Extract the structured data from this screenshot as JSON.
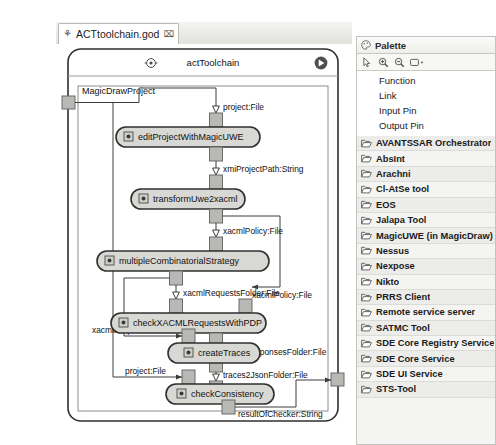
{
  "window": {
    "tab": {
      "label": "ACTtoolchain.god",
      "close_label": "⌧",
      "icon": "activity-diagram-icon"
    }
  },
  "diagram": {
    "title": "actToolchain",
    "title_icon": "activity-icon",
    "run_button_icon": "play-circle-icon",
    "frame_label": "MagicDrawProject",
    "nodes": [
      {
        "id": "n1",
        "label": "editProjectWithMagicUWE"
      },
      {
        "id": "n2",
        "label": "transformUwe2xacml"
      },
      {
        "id": "n3",
        "label": "multipleCombinatorialStrategy"
      },
      {
        "id": "n4",
        "label": "checkXACMLRequestsWithPDP"
      },
      {
        "id": "n5",
        "label": "createTraces"
      },
      {
        "id": "n6",
        "label": "checkConsistency"
      }
    ],
    "edge_labels": {
      "e1": "project:File",
      "e2": "xmiProjectPath:String",
      "e3": "xacmlPolicy:File",
      "e4": "xacmlRequestsFolder:File",
      "e5": "xacmlPolicy:File",
      "e6": "xacmlRequestsFolder:File",
      "e7": "xacmlResponsesFolder:File",
      "e8": "traces2JsonFolder:File",
      "e9": "project:File",
      "e10": "resultOfChecker:String"
    }
  },
  "palette": {
    "title": "Palette",
    "title_icon": "palette-icon",
    "tools": [
      {
        "name": "select-tool",
        "icon": "cursor-arrow-icon"
      },
      {
        "name": "zoom-in-tool",
        "icon": "zoom-in-icon"
      },
      {
        "name": "zoom-out-tool",
        "icon": "zoom-out-icon"
      },
      {
        "name": "layout-tool",
        "icon": "layout-dropdown-icon"
      }
    ],
    "basic_items": [
      "Function",
      "Link",
      "Input Pin",
      "Output Pin"
    ],
    "categories": [
      "AVANTSSAR Orchestrator",
      "AbsInt",
      "Arachni",
      "Cl-AtSe tool",
      "EOS",
      "Jalapa Tool",
      "MagicUWE (in MagicDraw)",
      "Nessus",
      "Nexpose",
      "Nikto",
      "PRRS Client",
      "Remote service server",
      "SATMC Tool",
      "SDE Core Registry Service",
      "SDE Core Service",
      "SDE UI Service",
      "STS-Tool"
    ]
  },
  "colors": {
    "node_fill": "#d8d8d4",
    "pin_fill": "#b8b8b4",
    "line": "#4a4a4a",
    "panel_bg": "#f4f4f2"
  }
}
